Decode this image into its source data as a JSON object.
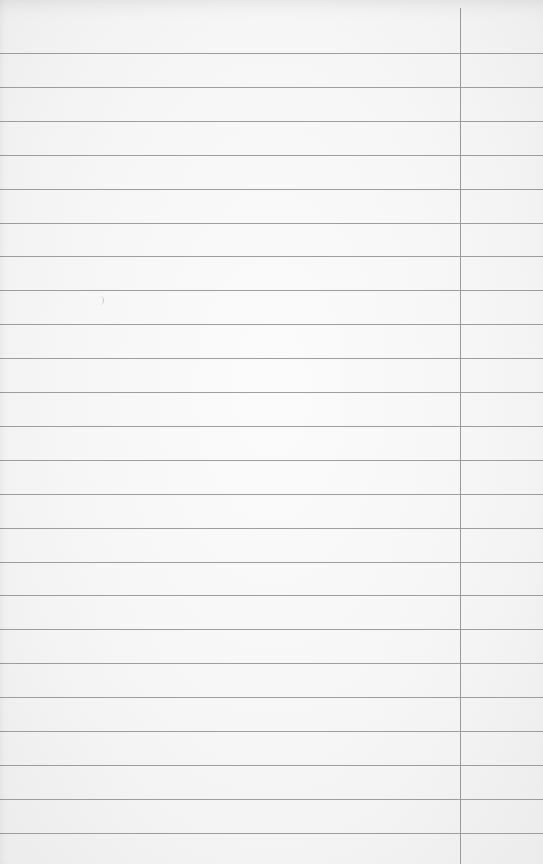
{
  "image": {
    "subject": "blank lined notebook paper",
    "rule_count": 24,
    "has_right_margin_line": true,
    "colors": {
      "paper": "#f7f7f7",
      "rule": "#8e8e8e",
      "margin_line": "#9a9a9a"
    }
  }
}
